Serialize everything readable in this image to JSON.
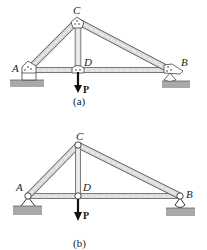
{
  "figures": [
    {
      "id": "a",
      "caption": "(a)",
      "joints": {
        "A": {
          "label": "A",
          "x": 28,
          "y": 70
        },
        "C": {
          "label": "C",
          "x": 77,
          "y": 21
        },
        "D": {
          "label": "D",
          "x": 78,
          "y": 70
        },
        "B": {
          "label": "B",
          "x": 170,
          "y": 70
        }
      },
      "members": [
        "AC",
        "CB",
        "CD",
        "AD",
        "DB"
      ],
      "load": {
        "label": "P",
        "at": "D",
        "direction": "down"
      },
      "connection_type": "gusset plate"
    },
    {
      "id": "b",
      "caption": "(b)",
      "joints": {
        "A": {
          "label": "A",
          "x": 28,
          "y": 196
        },
        "C": {
          "label": "C",
          "x": 78,
          "y": 145
        },
        "D": {
          "label": "D",
          "x": 78,
          "y": 196
        },
        "B": {
          "label": "B",
          "x": 180,
          "y": 196
        }
      },
      "members": [
        "AC",
        "CB",
        "CD",
        "AD",
        "DB"
      ],
      "load": {
        "label": "P",
        "at": "D",
        "direction": "down"
      },
      "connection_type": "pin"
    }
  ],
  "colors": {
    "member_fill": "#d8d8d8",
    "member_stroke": "#555555",
    "ground": "#a9a9a9",
    "arrow": "#111111"
  }
}
